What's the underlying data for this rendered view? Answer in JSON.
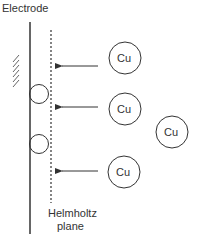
{
  "title": "Electrode",
  "plane_label_line1": "Helmholtz",
  "plane_label_line2": "plane",
  "ions": [
    {
      "label": "Cu"
    },
    {
      "label": "Cu"
    },
    {
      "label": "Cu"
    },
    {
      "label": "Cu"
    }
  ],
  "colors": {
    "stroke": "#333333",
    "text": "#333333"
  }
}
